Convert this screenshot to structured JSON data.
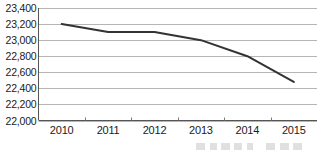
{
  "chart_data": {
    "type": "line",
    "title": "",
    "subtitle": "",
    "xlabel": "",
    "ylabel": "",
    "categories": [
      "2010",
      "2011",
      "2012",
      "2013",
      "2014",
      "2015"
    ],
    "series": [
      {
        "name": "",
        "values": [
          23200,
          23100,
          23100,
          23000,
          22800,
          22480
        ],
        "color": "#333333",
        "line_width_px": 2
      }
    ],
    "ylim": [
      22000,
      23400
    ],
    "ytick_values": [
      23400,
      23200,
      23000,
      22800,
      22600,
      22400,
      22200,
      22000
    ],
    "ytick_labels": [
      "23,400",
      "23,200",
      "23,000",
      "22,800",
      "22,600",
      "22,400",
      "22,200",
      "22,000"
    ],
    "xtick_labels": [
      "2010",
      "2011",
      "2012",
      "2013",
      "2014",
      "2015"
    ],
    "grid": true,
    "grid_axis": "y",
    "grid_color": "#b5b5b5",
    "axis_color": "#555555",
    "legend": false,
    "legend_position": "none",
    "background_color": "#ffffff"
  },
  "axes": {
    "y_labels": [
      {
        "text": "23,400"
      },
      {
        "text": "23,200"
      },
      {
        "text": "23,000"
      },
      {
        "text": "22,800"
      },
      {
        "text": "22,600"
      },
      {
        "text": "22,400"
      },
      {
        "text": "22,200"
      },
      {
        "text": "22,000"
      }
    ],
    "x_labels": [
      {
        "text": "2010"
      },
      {
        "text": "2011"
      },
      {
        "text": "2012"
      },
      {
        "text": "2013"
      },
      {
        "text": "2014"
      },
      {
        "text": "2015"
      }
    ]
  }
}
